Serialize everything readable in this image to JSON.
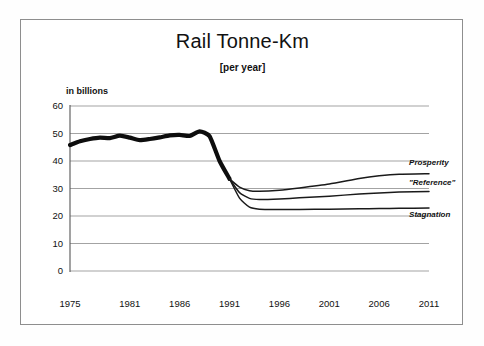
{
  "chart_data": {
    "type": "line",
    "title": "Rail Tonne-Km",
    "subtitle": "[per year]",
    "ylabel": "in billions",
    "xlabel": "",
    "ylim": [
      0,
      60
    ],
    "ytick_values": [
      0,
      10,
      20,
      30,
      40,
      50,
      60
    ],
    "ytick_labels": [
      "0",
      "10",
      "20",
      "30",
      "40",
      "50",
      "60"
    ],
    "xlim": [
      1975,
      2011
    ],
    "xtick_values": [
      1975,
      1981,
      1986,
      1991,
      1996,
      2001,
      2006,
      2011
    ],
    "xtick_labels": [
      "1975",
      "1981",
      "1986",
      "1991",
      "1996",
      "2001",
      "2006",
      "2011"
    ],
    "grid": "horizontal",
    "legend_position": "right-inline",
    "series": [
      {
        "name": "Historical",
        "style": "thick-black",
        "x": [
          1975,
          1976,
          1977,
          1978,
          1979,
          1980,
          1981,
          1982,
          1983,
          1984,
          1985,
          1986,
          1987,
          1988,
          1989,
          1990,
          1991
        ],
        "values": [
          45.8,
          47.2,
          48.0,
          48.5,
          48.3,
          49.2,
          48.5,
          47.6,
          48.0,
          48.6,
          49.3,
          49.5,
          49.1,
          50.8,
          49.0,
          40.0,
          33.5
        ]
      },
      {
        "name": "Prosperity",
        "style": "thin-black",
        "x": [
          1991,
          1992,
          1993,
          1994,
          1996,
          1998,
          2001,
          2004,
          2006,
          2008,
          2011
        ],
        "values": [
          33.5,
          30.5,
          29.2,
          29.0,
          29.4,
          30.2,
          31.6,
          33.6,
          34.6,
          35.2,
          35.4
        ]
      },
      {
        "name": "\"Reference\"",
        "style": "thin-black",
        "x": [
          1991,
          1992,
          1993,
          1994,
          1996,
          1998,
          2001,
          2004,
          2006,
          2008,
          2011
        ],
        "values": [
          33.5,
          28.5,
          26.4,
          26.0,
          26.2,
          26.6,
          27.2,
          28.0,
          28.4,
          28.7,
          28.9
        ]
      },
      {
        "name": "Stagnation",
        "style": "thin-black",
        "x": [
          1991,
          1992,
          1993,
          1994,
          1996,
          1998,
          2001,
          2004,
          2006,
          2008,
          2011
        ],
        "values": [
          33.5,
          26.5,
          23.2,
          22.5,
          22.4,
          22.4,
          22.5,
          22.6,
          22.7,
          22.8,
          22.9
        ]
      }
    ],
    "annotations": [
      {
        "text": "Prosperity",
        "x": 2009,
        "y": 38.5
      },
      {
        "text": "\"Reference\"",
        "x": 2009,
        "y": 31.2
      },
      {
        "text": "Stagnation",
        "x": 2009,
        "y": 19.8
      }
    ]
  }
}
